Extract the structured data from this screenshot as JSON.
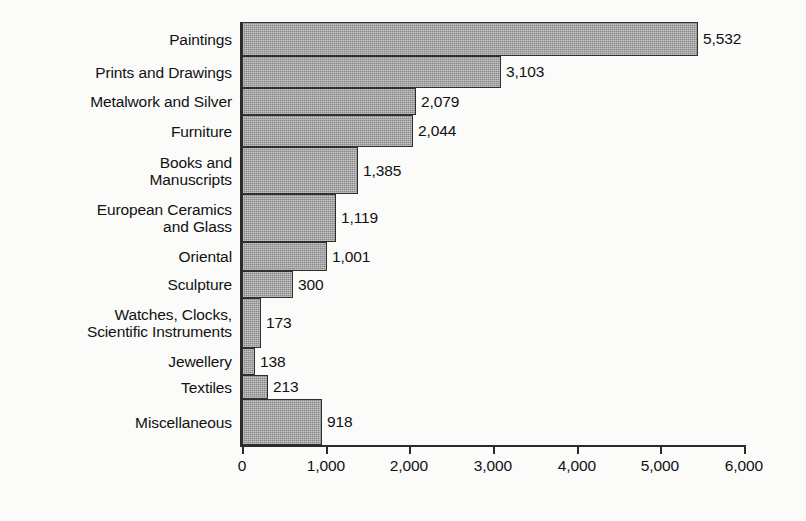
{
  "chart_data": {
    "type": "bar",
    "orientation": "horizontal",
    "title": "",
    "subtitle": "",
    "xlabel": "",
    "ylabel": "",
    "xlim": [
      0,
      6000
    ],
    "grid": false,
    "legend": null,
    "bar_color": "#8a8a8a",
    "bar_border_color": "#2f2f2f",
    "axis_color": "#2b2b2b",
    "text_color": "#111111",
    "x_ticks": [
      {
        "value": 0,
        "label": "0"
      },
      {
        "value": 1000,
        "label": "1,000"
      },
      {
        "value": 2000,
        "label": "2,000"
      },
      {
        "value": 3000,
        "label": "3,000"
      },
      {
        "value": 4000,
        "label": "4,000"
      },
      {
        "value": 5000,
        "label": "5,000"
      },
      {
        "value": 6000,
        "label": "6,000"
      }
    ],
    "categories": [
      "Paintings",
      "Prints and Drawings",
      "Metalwork and Silver",
      "Furniture",
      "Books and\nManuscripts",
      "European Ceramics\nand Glass",
      "Oriental",
      "Sculpture",
      "Watches, Clocks,\nScientific Instruments",
      "Jewellery",
      "Textiles",
      "Miscellaneous"
    ],
    "values": [
      5532,
      3103,
      2079,
      2044,
      1385,
      1119,
      1001,
      300,
      173,
      138,
      213,
      918
    ],
    "value_labels": [
      "5,532",
      "3,103",
      "2,079",
      "2,044",
      "1,385",
      "1,119",
      "1,001",
      "300",
      "173",
      "138",
      "213",
      "918"
    ],
    "bars": [
      {
        "label": "Paintings",
        "value": 5532,
        "value_label": "5,532",
        "top": 22,
        "height": 34,
        "pixel_width": 456
      },
      {
        "label": "Prints and Drawings",
        "value": 3103,
        "value_label": "3,103",
        "top": 56,
        "height": 32,
        "pixel_width": 259
      },
      {
        "label": "Metalwork and Silver",
        "value": 2079,
        "value_label": "2,079",
        "top": 88,
        "height": 27,
        "pixel_width": 174
      },
      {
        "label": "Furniture",
        "value": 2044,
        "value_label": "2,044",
        "top": 115,
        "height": 32,
        "pixel_width": 171
      },
      {
        "label": "Books and\nManuscripts",
        "value": 1385,
        "value_label": "1,385",
        "top": 147,
        "height": 47,
        "pixel_width": 116
      },
      {
        "label": "European Ceramics\nand Glass",
        "value": 1119,
        "value_label": "1,119",
        "top": 194,
        "height": 48,
        "pixel_width": 94
      },
      {
        "label": "Oriental",
        "value": 1001,
        "value_label": "1,001",
        "top": 242,
        "height": 29,
        "pixel_width": 85
      },
      {
        "label": "Sculpture",
        "value": 300,
        "value_label": "300",
        "top": 271,
        "height": 27,
        "pixel_width": 51
      },
      {
        "label": "Watches, Clocks,\nScientific Instruments",
        "value": 173,
        "value_label": "173",
        "top": 298,
        "height": 50,
        "pixel_width": 19
      },
      {
        "label": "Jewellery",
        "value": 138,
        "value_label": "138",
        "top": 348,
        "height": 27,
        "pixel_width": 13
      },
      {
        "label": "Textiles",
        "value": 213,
        "value_label": "213",
        "top": 375,
        "height": 24,
        "pixel_width": 26
      },
      {
        "label": "Miscellaneous",
        "value": 918,
        "value_label": "918",
        "top": 399,
        "height": 46,
        "pixel_width": 80
      }
    ]
  }
}
